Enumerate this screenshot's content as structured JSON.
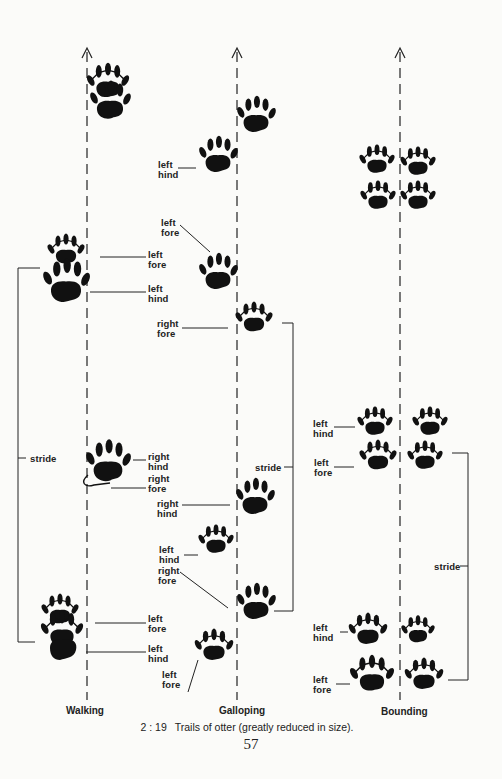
{
  "figure": {
    "number": "2 : 19",
    "caption": "Trails of otter (greatly reduced in size).",
    "page_number": "57"
  },
  "trails": {
    "walking": {
      "title": "Walking",
      "labels": {
        "l1": "left\nfore",
        "l2": "left\nhind",
        "stride": "stride",
        "l3": "right\nhind",
        "l4": "right\nfore",
        "l5": "left\nfore",
        "l6": "left\nhind"
      }
    },
    "galloping": {
      "title": "Galloping",
      "labels": {
        "l1": "left\nhind",
        "l2": "left\nfore",
        "l3": "right\nfore",
        "stride": "stride",
        "l4": "right\nhind",
        "l5": "left\nhind",
        "l6": "right\nfore",
        "l7": "left\nfore"
      }
    },
    "bounding": {
      "title": "Bounding",
      "labels": {
        "l1": "left\nhind",
        "l2": "left\nfore",
        "stride": "stride",
        "l3": "left\nhind",
        "l4": "left\nfore"
      }
    }
  },
  "colors": {
    "ink": "#111111",
    "paper": "#fbfbf9"
  }
}
